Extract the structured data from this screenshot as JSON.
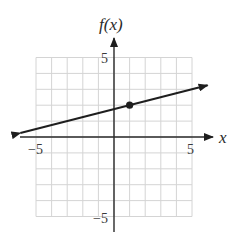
{
  "chart_data": {
    "type": "line",
    "title": "",
    "xlabel": "x",
    "ylabel": "f(x)",
    "xlim": [
      -5,
      5
    ],
    "ylim": [
      -5,
      5
    ],
    "grid": true,
    "x_ticks_labeled": [
      -5,
      5
    ],
    "y_ticks_labeled": [
      5,
      -5
    ],
    "tick_labels": {
      "x_neg": "−5",
      "x_pos": "5",
      "y_pos": "5",
      "y_neg": "−5"
    },
    "series": [
      {
        "name": "f(x)",
        "equation": "f(x) = 0.25x + 1.75",
        "slope": 0.25,
        "intercept": 1.75,
        "x": [
          -6,
          6
        ],
        "values": [
          0.25,
          3.25
        ],
        "arrows": "both"
      }
    ],
    "points": [
      {
        "x": 1,
        "y": 2,
        "style": "filled-dot"
      }
    ]
  },
  "labels": {
    "x_axis": "x",
    "y_axis": "f(x)"
  }
}
